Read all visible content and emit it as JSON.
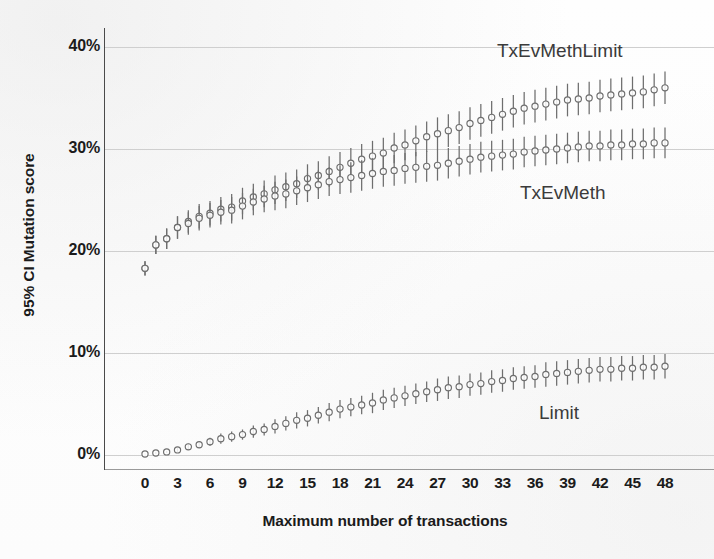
{
  "chart_data": {
    "type": "scatter",
    "title": "",
    "xlabel": "Maximum number of transactions",
    "ylabel": "95% CI Mutation score",
    "xlim": [
      -1,
      49
    ],
    "ylim": [
      0,
      42
    ],
    "grid": true,
    "gridlines_y": [
      0,
      10,
      20,
      30,
      40
    ],
    "y_tick_labels": [
      "0%",
      "10%",
      "20%",
      "30%",
      "40%"
    ],
    "y_tick_values": [
      0,
      10,
      20,
      30,
      40
    ],
    "x_tick_labels": [
      "0",
      "3",
      "6",
      "9",
      "12",
      "15",
      "18",
      "21",
      "24",
      "27",
      "30",
      "33",
      "36",
      "39",
      "42",
      "45",
      "48"
    ],
    "x_tick_values": [
      0,
      3,
      6,
      9,
      12,
      15,
      18,
      21,
      24,
      27,
      30,
      33,
      36,
      39,
      42,
      45,
      48
    ],
    "legend_position": "inline-annotations",
    "marker": "open-circle-with-error-bars",
    "error_bar_type": "95% confidence interval",
    "series": [
      {
        "name": "TxEvMethLimit",
        "color": "#6e6e6e",
        "x": [
          0,
          1,
          2,
          3,
          4,
          5,
          6,
          7,
          8,
          9,
          10,
          11,
          12,
          13,
          14,
          15,
          16,
          17,
          18,
          19,
          20,
          21,
          22,
          23,
          24,
          25,
          26,
          27,
          28,
          29,
          30,
          31,
          32,
          33,
          34,
          35,
          36,
          37,
          38,
          39,
          40,
          41,
          42,
          43,
          44,
          45,
          46,
          47,
          48
        ],
        "values": [
          18.3,
          20.6,
          21.2,
          22.3,
          22.9,
          23.4,
          23.7,
          24.1,
          24.3,
          24.9,
          25.3,
          25.6,
          26.0,
          26.3,
          26.6,
          27.1,
          27.4,
          27.8,
          28.2,
          28.6,
          29.0,
          29.3,
          29.6,
          30.1,
          30.4,
          30.8,
          31.2,
          31.5,
          31.8,
          32.1,
          32.5,
          32.8,
          33.1,
          33.4,
          33.7,
          34.0,
          34.2,
          34.4,
          34.6,
          34.8,
          34.9,
          35.0,
          35.2,
          35.3,
          35.4,
          35.5,
          35.6,
          35.8,
          36.0
        ],
        "err_low": [
          0.7,
          0.9,
          1.0,
          1.1,
          1.1,
          1.2,
          1.2,
          1.2,
          1.3,
          1.3,
          1.3,
          1.3,
          1.4,
          1.4,
          1.4,
          1.4,
          1.4,
          1.5,
          1.5,
          1.5,
          1.5,
          1.5,
          1.5,
          1.5,
          1.5,
          1.5,
          1.5,
          1.6,
          1.6,
          1.6,
          1.6,
          1.6,
          1.6,
          1.6,
          1.6,
          1.6,
          1.6,
          1.6,
          1.6,
          1.6,
          1.6,
          1.6,
          1.6,
          1.6,
          1.6,
          1.6,
          1.6,
          1.6,
          1.6
        ],
        "err_high": [
          0.7,
          0.9,
          1.0,
          1.1,
          1.1,
          1.2,
          1.2,
          1.2,
          1.3,
          1.3,
          1.3,
          1.3,
          1.4,
          1.4,
          1.4,
          1.4,
          1.4,
          1.5,
          1.5,
          1.5,
          1.5,
          1.5,
          1.5,
          1.5,
          1.5,
          1.5,
          1.5,
          1.6,
          1.6,
          1.6,
          1.6,
          1.6,
          1.6,
          1.6,
          1.6,
          1.6,
          1.6,
          1.6,
          1.6,
          1.6,
          1.6,
          1.6,
          1.6,
          1.6,
          1.6,
          1.6,
          1.6,
          1.6,
          1.6
        ]
      },
      {
        "name": "TxEvMeth",
        "color": "#6e6e6e",
        "x": [
          0,
          1,
          2,
          3,
          4,
          5,
          6,
          7,
          8,
          9,
          10,
          11,
          12,
          13,
          14,
          15,
          16,
          17,
          18,
          19,
          20,
          21,
          22,
          23,
          24,
          25,
          26,
          27,
          28,
          29,
          30,
          31,
          32,
          33,
          34,
          35,
          36,
          37,
          38,
          39,
          40,
          41,
          42,
          43,
          44,
          45,
          46,
          47,
          48
        ],
        "values": [
          18.3,
          20.6,
          21.2,
          22.3,
          22.7,
          23.2,
          23.5,
          23.8,
          24.0,
          24.4,
          24.8,
          25.1,
          25.4,
          25.6,
          25.9,
          26.2,
          26.5,
          26.8,
          27.0,
          27.2,
          27.4,
          27.6,
          27.8,
          27.9,
          28.1,
          28.2,
          28.3,
          28.4,
          28.6,
          28.8,
          29.0,
          29.2,
          29.3,
          29.4,
          29.5,
          29.7,
          29.8,
          29.9,
          30.0,
          30.1,
          30.2,
          30.3,
          30.3,
          30.4,
          30.4,
          30.5,
          30.5,
          30.6,
          30.6
        ],
        "err_low": [
          0.7,
          0.9,
          1.0,
          1.1,
          1.1,
          1.2,
          1.2,
          1.2,
          1.3,
          1.3,
          1.3,
          1.3,
          1.4,
          1.4,
          1.4,
          1.4,
          1.4,
          1.4,
          1.4,
          1.5,
          1.5,
          1.5,
          1.5,
          1.5,
          1.5,
          1.5,
          1.5,
          1.5,
          1.5,
          1.5,
          1.5,
          1.5,
          1.5,
          1.5,
          1.5,
          1.5,
          1.5,
          1.5,
          1.5,
          1.5,
          1.5,
          1.5,
          1.5,
          1.5,
          1.5,
          1.5,
          1.5,
          1.5,
          1.5
        ],
        "err_high": [
          0.7,
          0.9,
          1.0,
          1.1,
          1.1,
          1.2,
          1.2,
          1.2,
          1.3,
          1.3,
          1.3,
          1.3,
          1.4,
          1.4,
          1.4,
          1.4,
          1.4,
          1.4,
          1.4,
          1.5,
          1.5,
          1.5,
          1.5,
          1.5,
          1.5,
          1.5,
          1.5,
          1.5,
          1.5,
          1.5,
          1.5,
          1.5,
          1.5,
          1.5,
          1.5,
          1.5,
          1.5,
          1.5,
          1.5,
          1.5,
          1.5,
          1.5,
          1.5,
          1.5,
          1.5,
          1.5,
          1.5,
          1.5,
          1.5
        ]
      },
      {
        "name": "Limit",
        "color": "#6e6e6e",
        "x": [
          0,
          1,
          2,
          3,
          4,
          5,
          6,
          7,
          8,
          9,
          10,
          11,
          12,
          13,
          14,
          15,
          16,
          17,
          18,
          19,
          20,
          21,
          22,
          23,
          24,
          25,
          26,
          27,
          28,
          29,
          30,
          31,
          32,
          33,
          34,
          35,
          36,
          37,
          38,
          39,
          40,
          41,
          42,
          43,
          44,
          45,
          46,
          47,
          48
        ],
        "values": [
          0.1,
          0.2,
          0.3,
          0.5,
          0.8,
          1.0,
          1.3,
          1.6,
          1.8,
          2.0,
          2.3,
          2.5,
          2.8,
          3.1,
          3.4,
          3.6,
          3.9,
          4.2,
          4.5,
          4.7,
          4.9,
          5.1,
          5.4,
          5.6,
          5.8,
          6.0,
          6.2,
          6.4,
          6.6,
          6.7,
          6.9,
          7.0,
          7.2,
          7.3,
          7.5,
          7.6,
          7.7,
          7.9,
          8.0,
          8.1,
          8.2,
          8.3,
          8.4,
          8.4,
          8.5,
          8.5,
          8.6,
          8.6,
          8.7
        ],
        "err_low": [
          0.05,
          0.1,
          0.1,
          0.2,
          0.3,
          0.3,
          0.4,
          0.5,
          0.5,
          0.5,
          0.6,
          0.6,
          0.7,
          0.7,
          0.8,
          0.8,
          0.8,
          0.9,
          0.9,
          0.9,
          0.9,
          1.0,
          1.0,
          1.0,
          1.0,
          1.0,
          1.0,
          1.1,
          1.1,
          1.1,
          1.1,
          1.1,
          1.1,
          1.1,
          1.1,
          1.1,
          1.1,
          1.2,
          1.2,
          1.2,
          1.2,
          1.2,
          1.2,
          1.2,
          1.2,
          1.2,
          1.2,
          1.2,
          1.2
        ],
        "err_high": [
          0.05,
          0.1,
          0.1,
          0.2,
          0.3,
          0.3,
          0.4,
          0.5,
          0.5,
          0.5,
          0.6,
          0.6,
          0.7,
          0.7,
          0.8,
          0.8,
          0.8,
          0.9,
          0.9,
          0.9,
          0.9,
          1.0,
          1.0,
          1.0,
          1.0,
          1.0,
          1.0,
          1.1,
          1.1,
          1.1,
          1.1,
          1.1,
          1.1,
          1.1,
          1.1,
          1.1,
          1.1,
          1.2,
          1.2,
          1.2,
          1.2,
          1.2,
          1.2,
          1.2,
          1.2,
          1.2,
          1.2,
          1.2,
          1.2
        ]
      }
    ],
    "annotations": [
      {
        "text": "TxEvMethLimit",
        "series": "TxEvMethLimit"
      },
      {
        "text": "TxEvMeth",
        "series": "TxEvMeth"
      },
      {
        "text": "Limit",
        "series": "Limit"
      }
    ],
    "colors": {
      "marker": "#6e6e6e",
      "gridline": "#cfcfcf",
      "axis": "#4a4a4a",
      "text": "#1b1b1b",
      "annotation_text": "#3b3b3b",
      "background": "#fdfdfd"
    }
  }
}
